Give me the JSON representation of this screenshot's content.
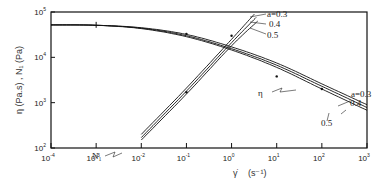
{
  "chart_data": {
    "type": "line",
    "title": "",
    "xlabel": "γ̇ (s⁻¹)",
    "ylabel": "η (Pa.s) , N₁ (Pa)",
    "xscale": "log",
    "yscale": "log",
    "xlim": [
      0.0001,
      1000
    ],
    "ylim": [
      100,
      100000
    ],
    "x_ticks": [
      "10^-4",
      "10^-3",
      "10^-2",
      "10^-1",
      "10^0",
      "10^1",
      "10^2",
      "10^3"
    ],
    "y_ticks": [
      "10^2",
      "10^3",
      "10^4",
      "10^5"
    ],
    "grid": false,
    "legend": "inline annotations",
    "series": [
      {
        "name": "η, a=0.3",
        "x": [
          0.0001,
          0.001,
          0.01,
          0.1,
          1,
          10,
          100,
          1000
        ],
        "y": [
          52000,
          51000,
          45000,
          32000,
          17000,
          7500,
          2600,
          900
        ]
      },
      {
        "name": "η, a=0.4",
        "x": [
          0.0001,
          0.001,
          0.01,
          0.1,
          1,
          10,
          100,
          1000
        ],
        "y": [
          52000,
          51000,
          44000,
          30000,
          15500,
          6700,
          2300,
          780
        ]
      },
      {
        "name": "η, a=0.5",
        "x": [
          0.0001,
          0.001,
          0.01,
          0.1,
          1,
          10,
          100,
          1000
        ],
        "y": [
          52000,
          51000,
          43000,
          28500,
          14500,
          6000,
          2000,
          680
        ]
      },
      {
        "name": "N1, a=0.3",
        "x": [
          0.01,
          0.1,
          1,
          3.2
        ],
        "y": [
          200,
          2100,
          25000,
          90000
        ]
      },
      {
        "name": "N1, a=0.4",
        "x": [
          0.01,
          0.1,
          1,
          3.5
        ],
        "y": [
          170,
          1800,
          21000,
          76000
        ]
      },
      {
        "name": "N1, a=0.5",
        "x": [
          0.01,
          0.1,
          1,
          3.8
        ],
        "y": [
          150,
          1550,
          18000,
          63000
        ]
      }
    ],
    "annotations": [
      {
        "text": "a=0.3",
        "target": "N1 top"
      },
      {
        "text": "0.4",
        "target": "N1 middle"
      },
      {
        "text": "0.5",
        "target": "N1 bottom"
      },
      {
        "text": "N₁",
        "target": "N1 curves"
      },
      {
        "text": "η",
        "target": "η curves"
      },
      {
        "text": "a=0.3",
        "target": "η top"
      },
      {
        "text": "0.4",
        "target": "η middle"
      },
      {
        "text": "0.5",
        "target": "η bottom"
      }
    ]
  },
  "labels": {
    "ylabel": "η (Pa.s) , N₁ (Pa)",
    "xlabel_symbol": "γ̇",
    "xlabel_unit": "(s⁻¹)",
    "n1": "N₁",
    "eta": "η",
    "n1_a03": "a=0.3",
    "n1_a04": "0.4",
    "n1_a05": "0.5",
    "eta_a03": "a=0.3",
    "eta_a04": "0.4",
    "eta_a05": "0.5"
  }
}
